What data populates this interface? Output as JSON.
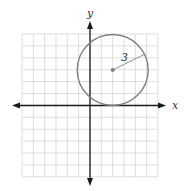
{
  "diagram": {
    "type": "coordinate-plane-circle",
    "x_axis_label": "x",
    "y_axis_label": "y",
    "grid": {
      "x_min": -6,
      "x_max": 6,
      "y_min": -6,
      "y_max": 6,
      "step": 1
    },
    "circle": {
      "center": [
        2,
        3
      ],
      "radius": 3,
      "radius_label": "3"
    },
    "colors": {
      "grid": "#d6d6d6",
      "axes": "#1a1a1a",
      "circle": "#808080",
      "label": "#333333"
    }
  }
}
